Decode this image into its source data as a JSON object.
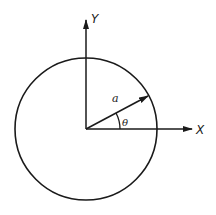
{
  "diagram": {
    "type": "polar-coordinate-circle",
    "labels": {
      "y_axis": "Y",
      "x_axis": "X",
      "radius": "a",
      "angle": "θ"
    },
    "colors": {
      "stroke": "#1a1a1a",
      "background": "#ffffff"
    }
  }
}
